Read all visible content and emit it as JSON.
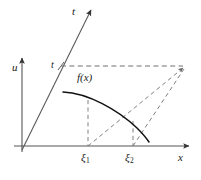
{
  "figure": {
    "background_color": "#ffffff",
    "stroke_color": "#4a4a4a",
    "curve_color": "#1a1a1a",
    "axis_color": "#555555",
    "labels": {
      "t_axis": "t",
      "u_axis": "u",
      "t_value": "t",
      "function": "f(x)",
      "xi_1_base": "ξ",
      "xi_1_sub": "1",
      "xi_2_base": "ξ",
      "xi_2_sub": "2",
      "x_axis": "x"
    },
    "geometry": {
      "origin_x": 22,
      "origin_y": 146,
      "x_axis_end_x": 191,
      "u_axis_top_y": 56,
      "t_ray_end_x": 92,
      "t_ray_end_y": 8,
      "t_level_y": 66,
      "dash_right_x": 185,
      "xi_1_x": 88,
      "xi_2_x": 133,
      "curve_start_x": 63,
      "curve_start_y": 92,
      "curve_end_x": 149,
      "curve_end_y": 141
    }
  }
}
